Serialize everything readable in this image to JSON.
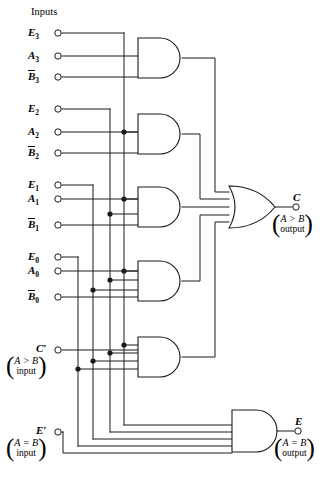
{
  "diagram": {
    "header_label": "Inputs",
    "line_color": "#1a1a1a",
    "background": "#ffffff"
  },
  "inputs": [
    {
      "id": "E3",
      "base": "E",
      "sub": "3",
      "overbar": false,
      "label": "E3",
      "y": 33
    },
    {
      "id": "A3",
      "base": "A",
      "sub": "3",
      "overbar": false,
      "label": "A3",
      "y": 56
    },
    {
      "id": "B3n",
      "base": "B",
      "sub": "3",
      "overbar": true,
      "label": "B3-bar",
      "y": 77
    },
    {
      "id": "E2",
      "base": "E",
      "sub": "2",
      "overbar": false,
      "label": "E2",
      "y": 109
    },
    {
      "id": "A2",
      "base": "A",
      "sub": "2",
      "overbar": false,
      "label": "A2",
      "y": 132
    },
    {
      "id": "B2n",
      "base": "B",
      "sub": "2",
      "overbar": true,
      "label": "B2-bar",
      "y": 153
    },
    {
      "id": "E1",
      "base": "E",
      "sub": "1",
      "overbar": false,
      "label": "E1",
      "y": 185
    },
    {
      "id": "A1",
      "base": "A",
      "sub": "1",
      "overbar": false,
      "label": "A1",
      "y": 199
    },
    {
      "id": "B1n",
      "base": "B",
      "sub": "1",
      "overbar": true,
      "label": "B1-bar",
      "y": 225
    },
    {
      "id": "E0",
      "base": "E",
      "sub": "0",
      "overbar": false,
      "label": "E0",
      "y": 257
    },
    {
      "id": "A0",
      "base": "A",
      "sub": "0",
      "overbar": false,
      "label": "A0",
      "y": 271
    },
    {
      "id": "B0n",
      "base": "B",
      "sub": "0",
      "overbar": true,
      "label": "B0-bar",
      "y": 297
    }
  ],
  "extra_inputs": [
    {
      "id": "Cprime",
      "symbol": "C′",
      "note_line1": "A > B",
      "note_line2": "input",
      "y": 350
    },
    {
      "id": "Eprime",
      "symbol": "E′",
      "note_line1": "A = B",
      "note_line2": "input",
      "y": 432
    }
  ],
  "outputs": [
    {
      "id": "C",
      "symbol": "C",
      "note_line1": "A > B",
      "note_line2": "output",
      "y": 207
    },
    {
      "id": "E",
      "symbol": "E",
      "note_line1": "A = B",
      "note_line2": "output",
      "y": 431
    }
  ],
  "gates": [
    {
      "id": "and3",
      "type": "AND",
      "inputs": 3,
      "x": 138,
      "y": 38,
      "w": 44,
      "h": 40,
      "label": "and-gate-bit3"
    },
    {
      "id": "and2",
      "type": "AND",
      "inputs": 3,
      "x": 138,
      "y": 114,
      "w": 44,
      "h": 40,
      "label": "and-gate-bit2"
    },
    {
      "id": "and1",
      "type": "AND",
      "inputs": 3,
      "x": 138,
      "y": 187,
      "w": 44,
      "h": 40,
      "label": "and-gate-bit1"
    },
    {
      "id": "and0",
      "type": "AND",
      "inputs": 4,
      "x": 138,
      "y": 261,
      "w": 44,
      "h": 40,
      "label": "and-gate-bit0"
    },
    {
      "id": "andc",
      "type": "AND",
      "inputs": 5,
      "x": 138,
      "y": 337,
      "w": 44,
      "h": 40,
      "label": "and-gate-cascade"
    },
    {
      "id": "ande",
      "type": "AND",
      "inputs": 5,
      "x": 232,
      "y": 410,
      "w": 48,
      "h": 42,
      "label": "and-gate-equal"
    },
    {
      "id": "orc",
      "type": "OR",
      "inputs": 5,
      "x": 229,
      "y": 186,
      "w": 46,
      "h": 42,
      "label": "or-gate-greater"
    }
  ],
  "buses": [
    {
      "id": "bus-E3",
      "x": 124,
      "source": "E3"
    },
    {
      "id": "bus-E2",
      "x": 110,
      "source": "E2"
    },
    {
      "id": "bus-E1",
      "x": 93,
      "source": "E1"
    },
    {
      "id": "bus-E0",
      "x": 78,
      "source": "E0"
    },
    {
      "id": "bus-Eprime",
      "x": 63,
      "source": "Eprime"
    }
  ],
  "junction_dots": [
    {
      "x": 124,
      "y": 132
    },
    {
      "x": 124,
      "y": 199
    },
    {
      "x": 110,
      "y": 214
    },
    {
      "x": 124,
      "y": 271
    },
    {
      "x": 110,
      "y": 280
    },
    {
      "x": 93,
      "y": 290
    },
    {
      "x": 124,
      "y": 345
    },
    {
      "x": 110,
      "y": 353
    },
    {
      "x": 93,
      "y": 361
    },
    {
      "x": 78,
      "y": 369
    }
  ]
}
